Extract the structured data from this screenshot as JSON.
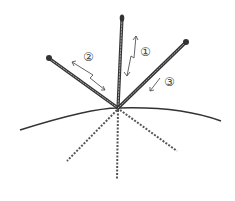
{
  "diagram": {
    "labels": [
      {
        "id": "1",
        "text": "①"
      },
      {
        "id": "2",
        "text": "②"
      },
      {
        "id": "3",
        "text": "③"
      }
    ],
    "colors": {
      "ink": "#333333",
      "needle_fill": "#888888",
      "background": "#ffffff"
    }
  }
}
